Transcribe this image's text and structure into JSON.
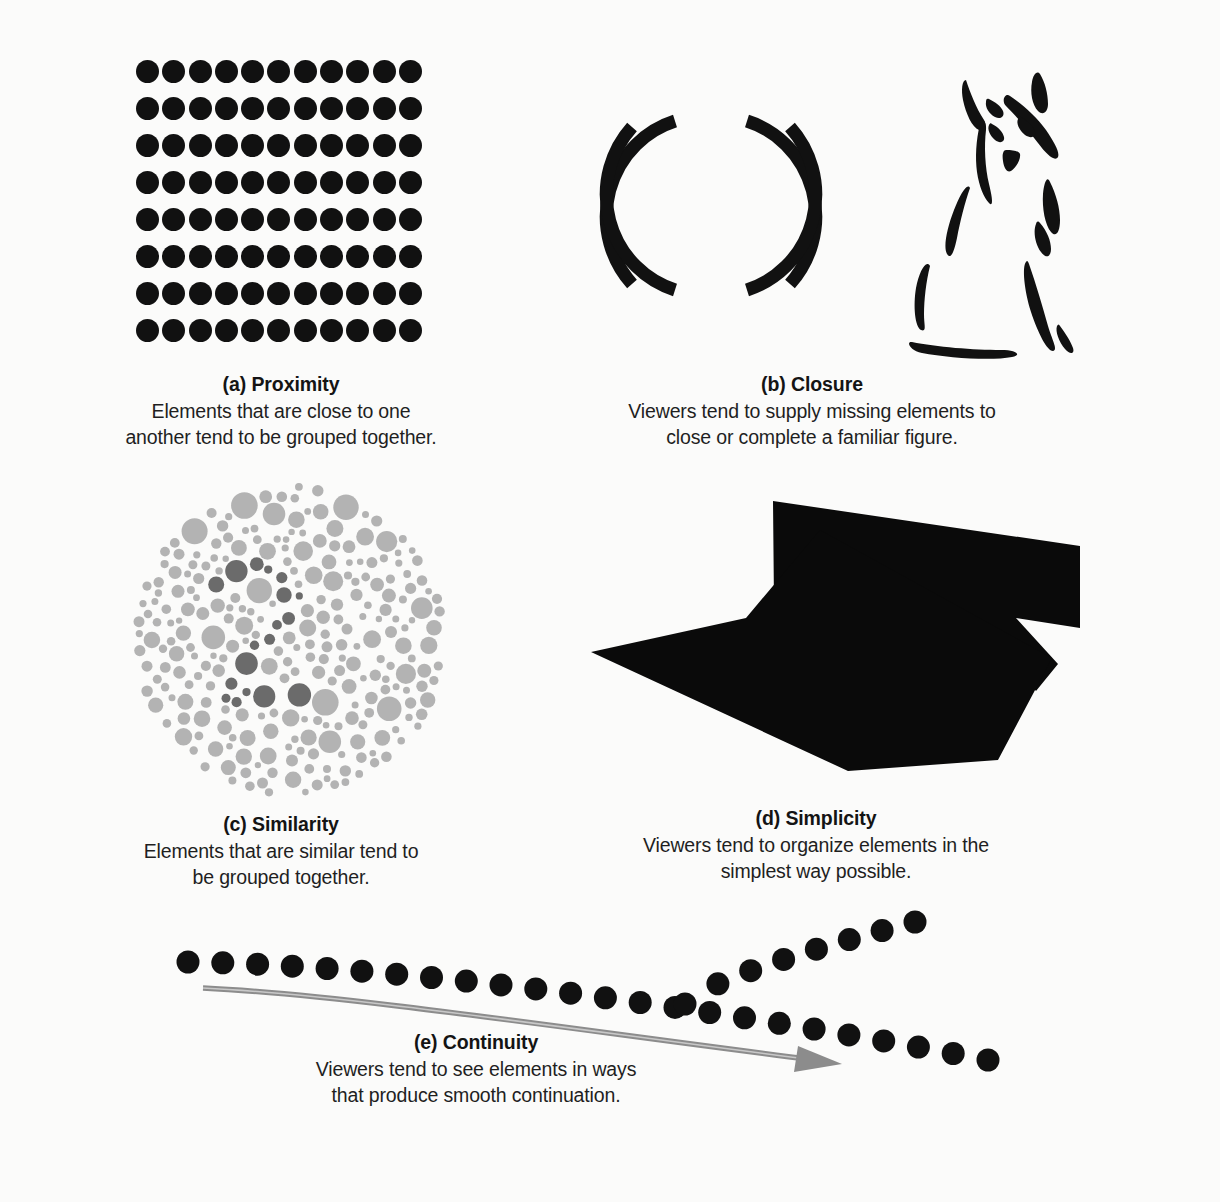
{
  "page": {
    "background_color": "#fbfbfa",
    "ink_color": "#111111"
  },
  "panels": [
    {
      "key": "a",
      "figure_name": "proximity-dot-grid",
      "label": "(a) Proximity",
      "lines": [
        "Elements that are close to one",
        "another tend to be grouped together."
      ],
      "grid": {
        "columns": 11,
        "rows": 8,
        "dot_diameter_px": 23,
        "h_pitch_px": 26.3,
        "v_pitch_px": 37
      }
    },
    {
      "key": "b",
      "figure_name": "closure-broken-circle-and-cat",
      "label": "(b) Closure",
      "lines": [
        "Viewers tend to supply missing elements to",
        "close or complete a familiar figure."
      ],
      "shapes": [
        "broken-circle-four-arcs",
        "cat-brush-stroke-silhouette"
      ]
    },
    {
      "key": "c",
      "figure_name": "similarity-ishihara-plate",
      "label": "(c) Similarity",
      "lines": [
        "Elements that are similar tend to",
        "be grouped together."
      ],
      "colors": {
        "light_dot": "#b3b3b3",
        "dark_dot": "#6b6b6b"
      }
    },
    {
      "key": "d",
      "figure_name": "simplicity-overlapping-quadrilaterals",
      "label": "(d) Simplicity",
      "lines": [
        "Viewers tend to organize elements in the",
        "simplest way possible."
      ],
      "shapes": [
        "rotated-rectangle-upper",
        "rotated-rectangle-lower"
      ]
    },
    {
      "key": "e",
      "figure_name": "continuity-crossing-dot-paths",
      "label": "(e) Continuity",
      "lines": [
        "Viewers tend to see elements in ways",
        "that produce smooth continuation."
      ],
      "shapes": [
        "dot-path-descending",
        "dot-path-ascending",
        "gray-curved-arrow"
      ],
      "arrow_color": "#8a8a8a"
    }
  ]
}
